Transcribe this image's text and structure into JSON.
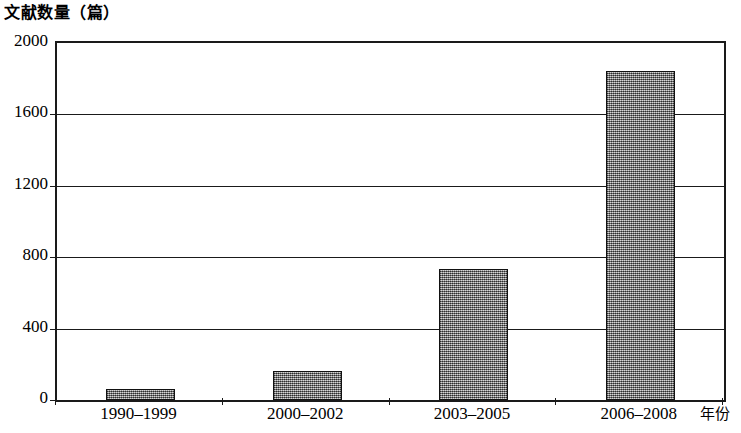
{
  "chart_data": {
    "type": "bar",
    "title": "文献数量（篇）",
    "xlabel": "年份",
    "ylabel": "文献数量（篇）",
    "categories": [
      "1990–1999",
      "2000–2002",
      "2003–2005",
      "2006–2008"
    ],
    "values": [
      60,
      165,
      735,
      1845
    ],
    "ylim": [
      0,
      2000
    ],
    "yticks": [
      0,
      400,
      800,
      1200,
      1600,
      2000
    ],
    "ytick_labels": [
      "0",
      "400",
      "800",
      "1200",
      "1600",
      "2000"
    ],
    "grid": true,
    "grid_axis": "y",
    "legend": false,
    "bar_fill": "#8a8a8a",
    "bar_edge": "#111111",
    "axis_color": "#1a1a1a",
    "background": "#ffffff"
  },
  "axes": {
    "y_title": "文献数量（篇）",
    "x_title": "年份"
  }
}
